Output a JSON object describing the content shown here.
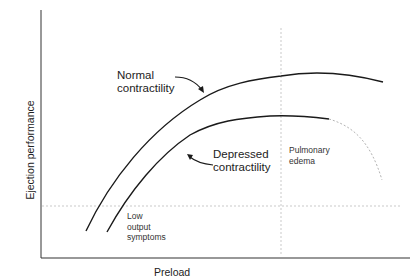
{
  "diagram": {
    "type": "frank-starling-curve",
    "axes": {
      "xlabel": "Preload",
      "ylabel": "Ejection performance"
    },
    "curves": [
      {
        "name": "normal",
        "label_line1": "Normal",
        "label_line2": "contractility",
        "style": "solid"
      },
      {
        "name": "depressed",
        "label_line1": "Depressed",
        "label_line2": "contractility",
        "style": "solid-then-dashed"
      }
    ],
    "thresholds": {
      "vertical": {
        "label_line1": "Pulmonary",
        "label_line2": "edema"
      },
      "horizontal": {
        "label_line1": "Low",
        "label_line2": "output",
        "label_line3": "symptoms"
      }
    },
    "colors": {
      "axis": "#222222",
      "curve": "#1a1a1a",
      "dashed": "#b0b0b0",
      "text": "#222222"
    }
  }
}
